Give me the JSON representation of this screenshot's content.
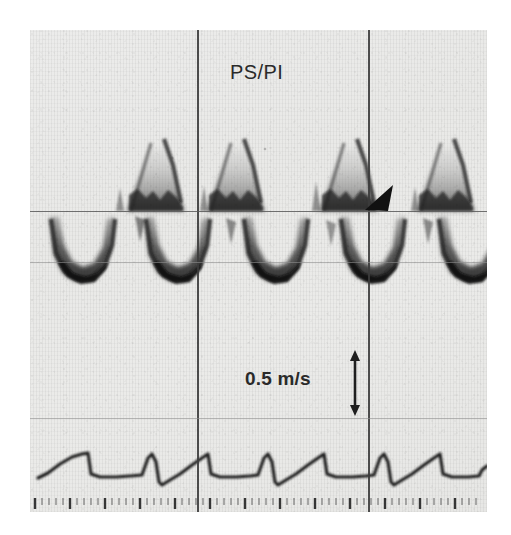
{
  "figure": {
    "kind": "doppler-spectral-tracing",
    "modality": "Pulsed-wave Doppler ultrasound spectral display with ECG trace",
    "background_color": "#ebebe9",
    "ink_color": "#2a2a2a",
    "page_background": "#ffffff"
  },
  "annotations": {
    "vessel_label": "PS/PI",
    "velocity_scale_label": "0.5 m/s",
    "velocity_scale_icon": "double-headed-vertical-arrow-icon",
    "marker_icon": "solid-triangular-arrowhead-icon"
  },
  "chart_data": {
    "type": "line",
    "title": "PS/PI",
    "xlabel": "",
    "ylabel": "Velocity (m/s)",
    "grid": true,
    "legend_position": "none",
    "axis": {
      "baseline_y_px": 181,
      "plate_width_px": 457,
      "plate_height_px": 482,
      "scale_reference": "0.5 m/s",
      "scale_reference_px": 51,
      "ylim": [
        -1.05,
        0.95
      ]
    },
    "gridlines": {
      "vertical_px": [
        167,
        338
      ],
      "horizontal_strong_px": [
        181
      ],
      "horizontal_faint_px": [
        232,
        388
      ]
    },
    "series": [
      {
        "name": "Forward (systolic) flow envelope",
        "polarity": "positive",
        "peaks_px_x": [
          125,
          205,
          318,
          415
        ],
        "peak_velocities": [
          0.82,
          0.8,
          0.76,
          0.78
        ]
      },
      {
        "name": "Reverse (diastolic) flow envelope",
        "polarity": "negative",
        "troughs_px_x": [
          55,
          150,
          248,
          345,
          440
        ],
        "trough_velocities": [
          -0.72,
          -0.74,
          -0.76,
          -0.74,
          -0.7
        ]
      },
      {
        "name": "ECG",
        "polarity": "reference",
        "r_wave_px_x": [
          60,
          158,
          254,
          352,
          448
        ]
      }
    ],
    "time_ruler": {
      "tick_spacing_px": 7,
      "major_every": 5,
      "tick_count": 64
    }
  }
}
